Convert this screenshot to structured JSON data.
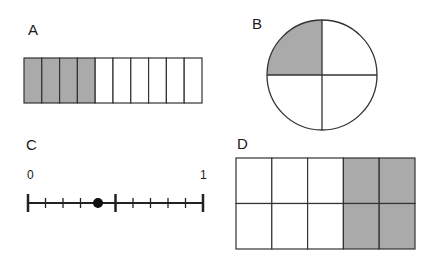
{
  "colors": {
    "shade": "#aaaaaa",
    "stroke": "#333333",
    "background": "#ffffff"
  },
  "panels": {
    "A": {
      "label": "A",
      "type": "fraction-strip",
      "total_cells": 10,
      "shaded_cells": 4,
      "fraction": "4/10"
    },
    "B": {
      "label": "B",
      "type": "fraction-circle",
      "total_sectors": 4,
      "shaded_sectors": 1,
      "shaded_position": "top-left",
      "fraction": "1/4"
    },
    "C": {
      "label": "C",
      "type": "number-line",
      "start_label": "0",
      "end_label": "1",
      "intervals": 10,
      "point_value": 0.4
    },
    "D": {
      "label": "D",
      "type": "fraction-grid",
      "rows": 2,
      "cols": 5,
      "shaded_columns": [
        4,
        5
      ],
      "shaded_cells": 4,
      "total_cells": 10,
      "fraction": "4/10"
    }
  }
}
